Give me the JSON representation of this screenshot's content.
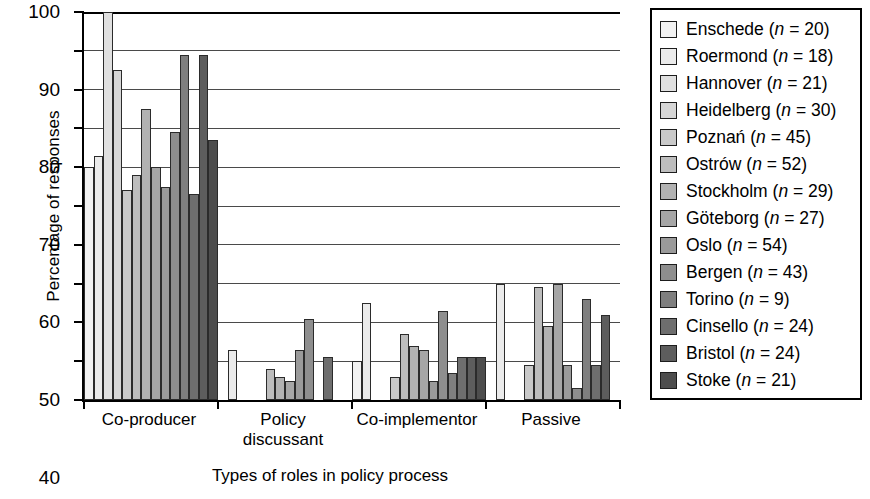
{
  "chart_data": {
    "type": "bar",
    "title": "",
    "xlabel": "Types of roles in policy process",
    "ylabel": "Percentage of responses",
    "ylim": [
      0,
      100
    ],
    "ytick_step": 10,
    "yticks": [
      0,
      10,
      20,
      30,
      40,
      50,
      60,
      70,
      80,
      90,
      100
    ],
    "grid": true,
    "legend_position": "right",
    "categories": [
      "Co-producer",
      "Policy\ndiscussant",
      "Co-implementor",
      "Passive"
    ],
    "series": [
      {
        "name": "Enschede",
        "n": 20,
        "label": "Enschede (n = 20)",
        "color": "#f2f2f2",
        "values": [
          60,
          0,
          10,
          0
        ]
      },
      {
        "name": "Roermond",
        "n": 18,
        "label": "Roermond (n = 18)",
        "color": "#ebebeb",
        "values": [
          63,
          13,
          25,
          30
        ]
      },
      {
        "name": "Hannover",
        "n": 21,
        "label": "Hannover (n = 21)",
        "color": "#e0e0e0",
        "values": [
          100,
          0,
          0,
          0
        ]
      },
      {
        "name": "Heidelberg",
        "n": 30,
        "label": "Heidelberg (n = 30)",
        "color": "#d6d6d6",
        "values": [
          85,
          0,
          0,
          0
        ]
      },
      {
        "name": "Poznań",
        "n": 45,
        "label": "Poznań (n = 45)",
        "color": "#c9c9c9",
        "values": [
          54,
          0,
          6,
          9
        ]
      },
      {
        "name": "Ostrów",
        "n": 52,
        "label": "Ostrów (n = 52)",
        "color": "#bdbdbd",
        "values": [
          58,
          8,
          17,
          29
        ]
      },
      {
        "name": "Stockholm",
        "n": 29,
        "label": "Stockholm (n = 29)",
        "color": "#b2b2b2",
        "values": [
          75,
          6,
          14,
          19
        ]
      },
      {
        "name": "Göteborg",
        "n": 27,
        "label": "Göteborg (n = 27)",
        "color": "#a6a6a6",
        "values": [
          60,
          5,
          13,
          30
        ]
      },
      {
        "name": "Oslo",
        "n": 54,
        "label": "Oslo (n = 54)",
        "color": "#9a9a9a",
        "values": [
          55,
          13,
          5,
          9
        ]
      },
      {
        "name": "Bergen",
        "n": 43,
        "label": "Bergen (n = 43)",
        "color": "#8e8e8e",
        "values": [
          69,
          21,
          23,
          3
        ]
      },
      {
        "name": "Torino",
        "n": 9,
        "label": "Torino (n = 9)",
        "color": "#7f7f7f",
        "values": [
          89,
          0,
          7,
          26
        ]
      },
      {
        "name": "Cinsello",
        "n": 24,
        "label": "Cinsello (n = 24)",
        "color": "#6e6e6e",
        "values": [
          53,
          11,
          11,
          9
        ]
      },
      {
        "name": "Bristol",
        "n": 24,
        "label": "Bristol (n = 24)",
        "color": "#5d5d5d",
        "values": [
          89,
          0,
          11,
          22
        ]
      },
      {
        "name": "Stoke",
        "n": 21,
        "label": "Stoke (n = 21)",
        "color": "#4d4d4d",
        "values": [
          67,
          0,
          11,
          0
        ]
      }
    ]
  }
}
